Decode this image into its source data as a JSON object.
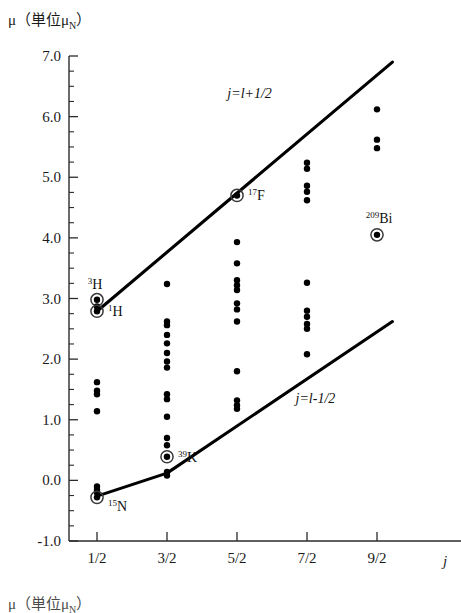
{
  "figure": {
    "y_axis_title": "μ（単位μ",
    "y_axis_title_sub": "N",
    "y_axis_title_close": "）",
    "bottom_axis_title": "μ（単位μ",
    "bottom_axis_title_sub": "N",
    "bottom_axis_title_close": "）",
    "x_axis_letter": "j"
  },
  "chart_data": {
    "type": "scatter",
    "title": "",
    "xlabel": "j",
    "ylabel": "μ (単位 μ_N)",
    "xlim": [
      0,
      5.5
    ],
    "ylim": [
      -1.0,
      7.0
    ],
    "grid": false,
    "legend_position": "inline-annotations",
    "x_tick_labels": [
      "1/2",
      "3/2",
      "5/2",
      "7/2",
      "9/2"
    ],
    "x_tick_values": [
      1,
      2,
      3,
      4,
      5
    ],
    "y_tick_labels": [
      "7.0",
      "6.0",
      "5.0",
      "4.0",
      "3.0",
      "2.0",
      "1.0",
      "0.0",
      "-1.0"
    ],
    "y_tick_values": [
      7.0,
      6.0,
      5.0,
      4.0,
      3.0,
      2.0,
      1.0,
      0.0,
      -1.0
    ],
    "y_minor_tick_step": 0.25,
    "series": [
      {
        "name": "j = l + 1/2 (Schmidt line, upper)",
        "type": "line",
        "label": "j=l+1/2",
        "label_x": 3.18,
        "label_y": 6.3,
        "x": [
          1,
          5.22
        ],
        "y": [
          2.79,
          6.9
        ]
      },
      {
        "name": "j = l - 1/2 (Schmidt line, lower)",
        "type": "line",
        "label": "j=l-1/2",
        "label_x": 4.12,
        "label_y": 1.28,
        "x": [
          1,
          2,
          5.22
        ],
        "y": [
          -0.26,
          0.12,
          2.62
        ]
      },
      {
        "name": "nuclear magnetic moments",
        "type": "points",
        "points": [
          {
            "x": 1,
            "y": 2.98,
            "circled": true,
            "label": "3H",
            "label_sup": "3",
            "label_base": "H",
            "label_pos": "above-left"
          },
          {
            "x": 1,
            "y": 2.87,
            "circled": false
          },
          {
            "x": 1,
            "y": 2.79,
            "circled": true,
            "label": "1H",
            "label_sup": "1",
            "label_base": "H",
            "label_pos": "right"
          },
          {
            "x": 1,
            "y": 1.62,
            "circled": false
          },
          {
            "x": 1,
            "y": 1.48,
            "circled": false
          },
          {
            "x": 1,
            "y": 1.42,
            "circled": false
          },
          {
            "x": 1,
            "y": 1.14,
            "circled": false
          },
          {
            "x": 1,
            "y": -0.1,
            "circled": false
          },
          {
            "x": 1,
            "y": -0.16,
            "circled": false
          },
          {
            "x": 1,
            "y": -0.2,
            "circled": false
          },
          {
            "x": 1,
            "y": -0.28,
            "circled": true,
            "label": "15N",
            "label_sup": "15",
            "label_base": "N",
            "label_pos": "below-right"
          },
          {
            "x": 2,
            "y": 3.24,
            "circled": false
          },
          {
            "x": 2,
            "y": 2.62,
            "circled": false
          },
          {
            "x": 2,
            "y": 2.56,
            "circled": false
          },
          {
            "x": 2,
            "y": 2.4,
            "circled": false
          },
          {
            "x": 2,
            "y": 2.26,
            "circled": false
          },
          {
            "x": 2,
            "y": 2.1,
            "circled": false
          },
          {
            "x": 2,
            "y": 1.96,
            "circled": false
          },
          {
            "x": 2,
            "y": 1.86,
            "circled": false
          },
          {
            "x": 2,
            "y": 1.42,
            "circled": false
          },
          {
            "x": 2,
            "y": 1.34,
            "circled": false
          },
          {
            "x": 2,
            "y": 1.05,
            "circled": false
          },
          {
            "x": 2,
            "y": 0.7,
            "circled": false
          },
          {
            "x": 2,
            "y": 0.58,
            "circled": false
          },
          {
            "x": 2,
            "y": 0.39,
            "circled": true,
            "label": "39K",
            "label_sup": "39",
            "label_base": "K",
            "label_pos": "right"
          },
          {
            "x": 2,
            "y": 0.14,
            "circled": false
          },
          {
            "x": 2,
            "y": 0.08,
            "circled": false
          },
          {
            "x": 3,
            "y": 4.7,
            "circled": true,
            "label": "17F",
            "label_sup": "17",
            "label_base": "F",
            "label_pos": "right"
          },
          {
            "x": 3,
            "y": 3.93,
            "circled": false
          },
          {
            "x": 3,
            "y": 3.58,
            "circled": false
          },
          {
            "x": 3,
            "y": 3.3,
            "circled": false
          },
          {
            "x": 3,
            "y": 3.22,
            "circled": false
          },
          {
            "x": 3,
            "y": 3.14,
            "circled": false
          },
          {
            "x": 3,
            "y": 2.92,
            "circled": false
          },
          {
            "x": 3,
            "y": 2.82,
            "circled": false
          },
          {
            "x": 3,
            "y": 2.62,
            "circled": false
          },
          {
            "x": 3,
            "y": 1.8,
            "circled": false
          },
          {
            "x": 3,
            "y": 1.32,
            "circled": false
          },
          {
            "x": 3,
            "y": 1.24,
            "circled": false
          },
          {
            "x": 3,
            "y": 1.18,
            "circled": false
          },
          {
            "x": 4,
            "y": 5.24,
            "circled": false
          },
          {
            "x": 4,
            "y": 5.14,
            "circled": false
          },
          {
            "x": 4,
            "y": 4.86,
            "circled": false
          },
          {
            "x": 4,
            "y": 4.76,
            "circled": false
          },
          {
            "x": 4,
            "y": 4.62,
            "circled": false
          },
          {
            "x": 4,
            "y": 3.26,
            "circled": false
          },
          {
            "x": 4,
            "y": 2.8,
            "circled": false
          },
          {
            "x": 4,
            "y": 2.7,
            "circled": false
          },
          {
            "x": 4,
            "y": 2.58,
            "circled": false
          },
          {
            "x": 4,
            "y": 2.5,
            "circled": false
          },
          {
            "x": 4,
            "y": 2.08,
            "circled": false
          },
          {
            "x": 5,
            "y": 6.12,
            "circled": false
          },
          {
            "x": 5,
            "y": 5.62,
            "circled": false
          },
          {
            "x": 5,
            "y": 5.48,
            "circled": false
          },
          {
            "x": 5,
            "y": 4.05,
            "circled": true,
            "label": "209Bi",
            "label_sup": "209",
            "label_base": "Bi",
            "label_pos": "above"
          }
        ]
      }
    ],
    "annotations": [
      {
        "text": "3H",
        "x": 1,
        "y": 2.98
      },
      {
        "text": "1H",
        "x": 1,
        "y": 2.79
      },
      {
        "text": "15N",
        "x": 1,
        "y": -0.28
      },
      {
        "text": "39K",
        "x": 2,
        "y": 0.39
      },
      {
        "text": "17F",
        "x": 3,
        "y": 4.7
      },
      {
        "text": "209Bi",
        "x": 5,
        "y": 4.05
      },
      {
        "text": "j=l+1/2",
        "x": 3.18,
        "y": 6.3
      },
      {
        "text": "j=l-1/2",
        "x": 4.12,
        "y": 1.28
      }
    ]
  }
}
